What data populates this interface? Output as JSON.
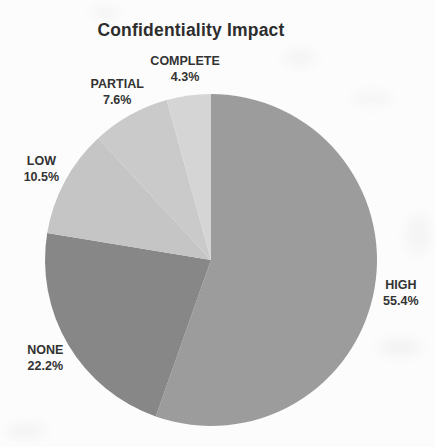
{
  "chart_data": {
    "type": "pie",
    "title": "Confidentiality Impact",
    "direction": "clockwise",
    "start_angle": "12-o-clock",
    "legend_position": "none",
    "label_position": "outside",
    "background_color": "#fcfcfc",
    "title_color": "#2d2d2d",
    "label_color": "#333333",
    "categories": [
      "HIGH",
      "NONE",
      "LOW",
      "PARTIAL",
      "COMPLETE"
    ],
    "values": [
      55.4,
      22.2,
      10.5,
      7.6,
      4.3
    ],
    "slices": [
      {
        "label": "HIGH",
        "value": 55.4,
        "pct_label": "55.4%",
        "color": "#9c9c9c"
      },
      {
        "label": "NONE",
        "value": 22.2,
        "pct_label": "22.2%",
        "color": "#878787"
      },
      {
        "label": "LOW",
        "value": 10.5,
        "pct_label": "10.5%",
        "color": "#c5c5c5"
      },
      {
        "label": "PARTIAL",
        "value": 7.6,
        "pct_label": "7.6%",
        "color": "#cacaca"
      },
      {
        "label": "COMPLETE",
        "value": 4.3,
        "pct_label": "4.3%",
        "color": "#d5d5d5"
      }
    ]
  }
}
